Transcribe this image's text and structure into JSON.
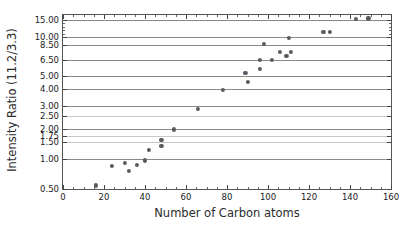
{
  "chart_data": {
    "type": "scatter",
    "title": "",
    "xlabel": "Number of Carbon atoms",
    "ylabel": "Intensity Ratio (11.2/3.3)",
    "xlim": [
      0,
      160
    ],
    "ylim": [
      0.5,
      16.5
    ],
    "grid": true,
    "legend": null,
    "yscale": "custom-nonlinear",
    "xticks": [
      0,
      20,
      40,
      60,
      80,
      100,
      120,
      140,
      160
    ],
    "xtick_labels": [
      "0",
      "20",
      "40",
      "60",
      "80",
      "100",
      "120",
      "140",
      "160"
    ],
    "yticks": [
      0.5,
      1.0,
      1.5,
      1.75,
      2.0,
      2.5,
      3.0,
      4.0,
      5.0,
      6.5,
      8.5,
      10.0,
      15.0
    ],
    "ytick_labels": [
      "0.50",
      "1.00",
      "1.50",
      "1.75",
      "2.00",
      "2.50",
      "3.00",
      "4.00",
      "5.00",
      "6.50",
      "8.50",
      "10.00",
      "15.00"
    ],
    "marker_color": "#5a5a63",
    "points": [
      {
        "x": 16,
        "y": 0.56
      },
      {
        "x": 24,
        "y": 0.88
      },
      {
        "x": 30,
        "y": 0.93
      },
      {
        "x": 32,
        "y": 0.8
      },
      {
        "x": 36,
        "y": 0.89
      },
      {
        "x": 40,
        "y": 0.97
      },
      {
        "x": 42,
        "y": 1.26
      },
      {
        "x": 48,
        "y": 1.6
      },
      {
        "x": 48,
        "y": 1.38
      },
      {
        "x": 54,
        "y": 1.98
      },
      {
        "x": 66,
        "y": 2.85
      },
      {
        "x": 78,
        "y": 3.95
      },
      {
        "x": 89,
        "y": 5.3
      },
      {
        "x": 90,
        "y": 4.55
      },
      {
        "x": 96,
        "y": 6.55
      },
      {
        "x": 96,
        "y": 5.65
      },
      {
        "x": 98,
        "y": 8.6
      },
      {
        "x": 102,
        "y": 6.55
      },
      {
        "x": 106,
        "y": 7.55
      },
      {
        "x": 109,
        "y": 7.1
      },
      {
        "x": 110,
        "y": 9.9
      },
      {
        "x": 111,
        "y": 7.55
      },
      {
        "x": 127,
        "y": 11.5
      },
      {
        "x": 130,
        "y": 11.5
      },
      {
        "x": 143,
        "y": 15.2
      },
      {
        "x": 149,
        "y": 15.45
      }
    ]
  }
}
